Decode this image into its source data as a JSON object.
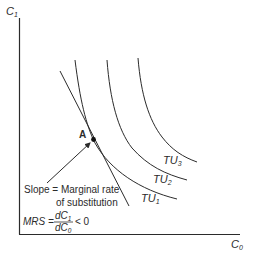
{
  "diagram": {
    "type": "indifference-curves",
    "axes": {
      "y_label": "C",
      "y_label_sub": "1",
      "x_label": "C",
      "x_label_sub": "0"
    },
    "curves": [
      {
        "id": "TU1",
        "label": "TU",
        "sub": "1"
      },
      {
        "id": "TU2",
        "label": "TU",
        "sub": "2"
      },
      {
        "id": "TU3",
        "label": "TU",
        "sub": "3"
      }
    ],
    "point": {
      "label": "A"
    },
    "annotation": {
      "line1": "Slope = Marginal rate",
      "line2": "of substitution"
    },
    "formula": {
      "lhs": "MRS =",
      "num": "dC",
      "num_sub": "1",
      "den": "dC",
      "den_sub": "0",
      "rhs": "< 0"
    },
    "colors": {
      "line": "#2b2b2b",
      "background": "#ffffff"
    }
  }
}
